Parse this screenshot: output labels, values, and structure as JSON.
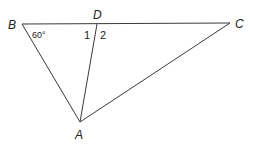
{
  "diagram": {
    "type": "triangle",
    "vertices": {
      "B": {
        "label": "B",
        "x": 22,
        "y": 24
      },
      "D": {
        "label": "D",
        "x": 97,
        "y": 24
      },
      "C": {
        "label": "C",
        "x": 230,
        "y": 23
      },
      "A": {
        "label": "A",
        "x": 80,
        "y": 122
      }
    },
    "segments": [
      {
        "name": "BC",
        "from": "B",
        "to": "C"
      },
      {
        "name": "BA",
        "from": "B",
        "to": "A"
      },
      {
        "name": "CA",
        "from": "C",
        "to": "A"
      },
      {
        "name": "DA",
        "from": "D",
        "to": "A"
      }
    ],
    "angle_labels": {
      "angle_B": "60°",
      "angle_1": "1",
      "angle_2": "2"
    },
    "colors": {
      "line": "#3a3a3a",
      "text": "#222222",
      "background": "#ffffff"
    }
  }
}
